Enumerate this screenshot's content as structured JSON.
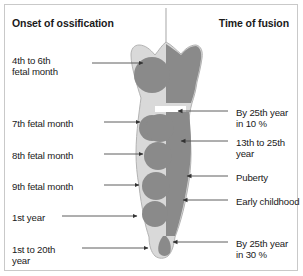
{
  "figure": {
    "title_left": "Onset of ossification",
    "title_right": "Time of fusion",
    "colors": {
      "cartilage": "#d9d9d9",
      "ossification": "#8a8a8a",
      "outline": "#b0b0b0",
      "leader": "#4d4d4d",
      "border": "#c9c9c9",
      "text": "#1a1a1a",
      "background": "#ffffff"
    }
  },
  "left_labels": [
    {
      "id": "l1",
      "text": "4th to 6th\nfetal month",
      "y": 55,
      "arrow_y": 63,
      "arrow_x_start": 92,
      "arrow_x_end": 143
    },
    {
      "id": "l2",
      "text": "7th fetal month",
      "y": 118,
      "arrow_y": 122,
      "arrow_x_start": 104,
      "arrow_x_end": 140
    },
    {
      "id": "l3",
      "text": "8th fetal month",
      "y": 150,
      "arrow_y": 154,
      "arrow_x_start": 104,
      "arrow_x_end": 143
    },
    {
      "id": "l4",
      "text": "9th fetal month",
      "y": 181,
      "arrow_y": 185,
      "arrow_x_start": 104,
      "arrow_x_end": 139
    },
    {
      "id": "l5",
      "text": "1st year",
      "y": 212,
      "arrow_y": 216,
      "arrow_x_start": 62,
      "arrow_x_end": 137
    },
    {
      "id": "l6",
      "text": "1st to 20th\nyear",
      "y": 244,
      "arrow_y": 248,
      "arrow_x_start": 82,
      "arrow_x_end": 148
    }
  ],
  "right_labels": [
    {
      "id": "r1",
      "text": "By 25th year\nin 10 %",
      "y": 107,
      "arrow_y": 111,
      "arrow_x_start": 228,
      "arrow_x_end": 178
    },
    {
      "id": "r2",
      "text": "13th to 25th\nyear",
      "y": 137,
      "arrow_y": 141,
      "arrow_x_start": 228,
      "arrow_x_end": 181
    },
    {
      "id": "r3",
      "text": "Puberty",
      "y": 172,
      "arrow_y": 176,
      "arrow_x_start": 228,
      "arrow_x_end": 187
    },
    {
      "id": "r4",
      "text": "Early childhood",
      "y": 196,
      "arrow_y": 200,
      "arrow_x_start": 228,
      "arrow_x_end": 183
    },
    {
      "id": "r5",
      "text": "By 25th year\nin  30 %",
      "y": 238,
      "arrow_y": 242,
      "arrow_x_start": 228,
      "arrow_x_end": 173
    }
  ],
  "bone": {
    "name": "femur-ossification-diagram",
    "top_line_x": 166,
    "top_line_y1": 8,
    "top_line_y2": 42,
    "epiphyseal_gap": {
      "x1": 155,
      "x2": 186,
      "y": 110
    }
  }
}
